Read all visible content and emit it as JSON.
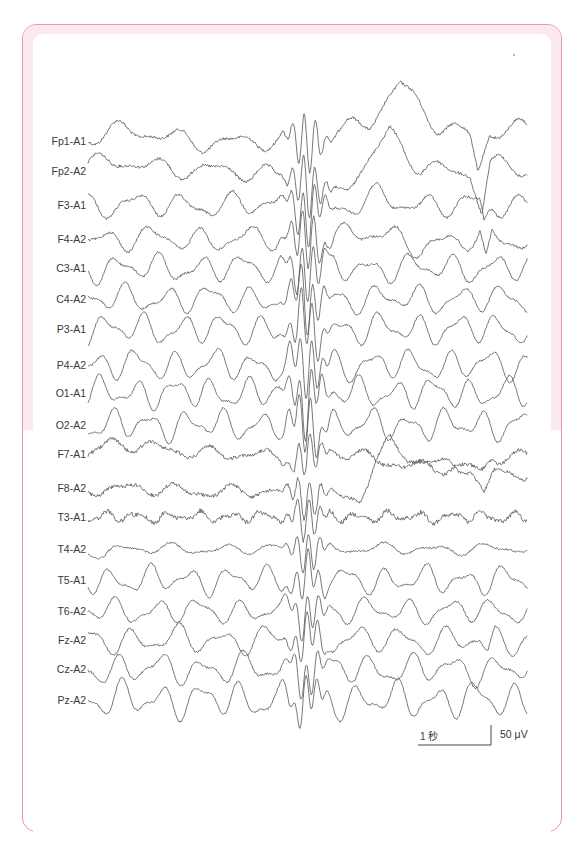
{
  "figure": {
    "frame_color": "#e79aa8",
    "band_color": "#fbe9ee",
    "trace_color": "#555555"
  },
  "chart_data": {
    "type": "line",
    "title": "",
    "x_range_px": [
      88,
      528
    ],
    "channels": [
      {
        "name": "Fp1-A1",
        "y": 141,
        "amp": 7,
        "freq": 0.11,
        "noise": 1.4,
        "drift": [
          [
            88,
            -6
          ],
          [
            120,
            -10
          ],
          [
            200,
            0
          ],
          [
            300,
            2
          ],
          [
            370,
            -20
          ],
          [
            400,
            -55
          ],
          [
            440,
            -15
          ],
          [
            470,
            -8
          ],
          [
            478,
            30
          ],
          [
            490,
            -10
          ],
          [
            528,
            -10
          ]
        ]
      },
      {
        "name": "Fp2-A2",
        "y": 171,
        "amp": 7,
        "freq": 0.11,
        "noise": 1.4,
        "drift": [
          [
            88,
            -4
          ],
          [
            120,
            -10
          ],
          [
            200,
            0
          ],
          [
            300,
            4
          ],
          [
            330,
            30
          ],
          [
            370,
            -10
          ],
          [
            390,
            -40
          ],
          [
            420,
            -5
          ],
          [
            470,
            4
          ],
          [
            482,
            40
          ],
          [
            490,
            -5
          ],
          [
            528,
            -3
          ]
        ]
      },
      {
        "name": "F3-A1",
        "y": 205,
        "amp": 9,
        "freq": 0.13,
        "noise": 1.2,
        "drift": [
          [
            88,
            0
          ],
          [
            300,
            0
          ],
          [
            340,
            6
          ],
          [
            380,
            -8
          ],
          [
            420,
            0
          ],
          [
            480,
            0
          ],
          [
            484,
            20
          ],
          [
            492,
            0
          ],
          [
            528,
            0
          ]
        ]
      },
      {
        "name": "F4-A2",
        "y": 239,
        "amp": 9,
        "freq": 0.13,
        "noise": 1.2,
        "drift": [
          [
            88,
            0
          ],
          [
            300,
            0
          ],
          [
            380,
            -5
          ],
          [
            420,
            6
          ],
          [
            480,
            0
          ],
          [
            486,
            30
          ],
          [
            492,
            0
          ],
          [
            528,
            0
          ]
        ]
      },
      {
        "name": "C3-A1",
        "y": 268,
        "amp": 10,
        "freq": 0.15,
        "noise": 1.0,
        "drift": [
          [
            88,
            0
          ],
          [
            528,
            0
          ]
        ]
      },
      {
        "name": "C4-A2",
        "y": 299,
        "amp": 10,
        "freq": 0.15,
        "noise": 1.0,
        "drift": [
          [
            88,
            0
          ],
          [
            528,
            0
          ]
        ]
      },
      {
        "name": "P3-A1",
        "y": 329,
        "amp": 11,
        "freq": 0.16,
        "noise": 0.9,
        "drift": [
          [
            88,
            0
          ],
          [
            528,
            0
          ]
        ]
      },
      {
        "name": "P4-A2",
        "y": 365,
        "amp": 11,
        "freq": 0.16,
        "noise": 0.9,
        "drift": [
          [
            88,
            0
          ],
          [
            528,
            0
          ]
        ]
      },
      {
        "name": "O1-A1",
        "y": 393,
        "amp": 11,
        "freq": 0.17,
        "noise": 0.9,
        "drift": [
          [
            88,
            0
          ],
          [
            528,
            0
          ]
        ]
      },
      {
        "name": "O2-A2",
        "y": 425,
        "amp": 11,
        "freq": 0.17,
        "noise": 0.9,
        "drift": [
          [
            88,
            0
          ],
          [
            528,
            0
          ]
        ]
      },
      {
        "name": "F7-A1",
        "y": 454,
        "amp": 5,
        "freq": 0.12,
        "noise": 1.8,
        "drift": [
          [
            88,
            0
          ],
          [
            110,
            -10
          ],
          [
            200,
            -2
          ],
          [
            300,
            5
          ],
          [
            330,
            -5
          ],
          [
            380,
            8
          ],
          [
            420,
            12
          ],
          [
            470,
            14
          ],
          [
            482,
            20
          ],
          [
            492,
            4
          ],
          [
            528,
            2
          ]
        ]
      },
      {
        "name": "F8-A2",
        "y": 488,
        "amp": 5,
        "freq": 0.12,
        "noise": 1.8,
        "drift": [
          [
            88,
            0
          ],
          [
            330,
            6
          ],
          [
            360,
            12
          ],
          [
            375,
            -25
          ],
          [
            390,
            -45
          ],
          [
            410,
            -30
          ],
          [
            470,
            -20
          ],
          [
            484,
            10
          ],
          [
            494,
            -15
          ],
          [
            528,
            -14
          ]
        ]
      },
      {
        "name": "T3-A1",
        "y": 517,
        "amp": 4,
        "freq": 0.2,
        "noise": 2.2,
        "drift": [
          [
            88,
            0
          ],
          [
            528,
            0
          ]
        ]
      },
      {
        "name": "T4-A2",
        "y": 549,
        "amp": 4,
        "freq": 0.12,
        "noise": 1.0,
        "drift": [
          [
            88,
            0
          ],
          [
            105,
            6
          ],
          [
            115,
            0
          ],
          [
            528,
            0
          ]
        ]
      },
      {
        "name": "T5-A1",
        "y": 580,
        "amp": 10,
        "freq": 0.16,
        "noise": 0.9,
        "drift": [
          [
            88,
            0
          ],
          [
            528,
            0
          ]
        ]
      },
      {
        "name": "T6-A2",
        "y": 611,
        "amp": 9,
        "freq": 0.15,
        "noise": 0.9,
        "drift": [
          [
            88,
            0
          ],
          [
            528,
            0
          ]
        ]
      },
      {
        "name": "Fz-A2",
        "y": 640,
        "amp": 10,
        "freq": 0.14,
        "noise": 1.0,
        "drift": [
          [
            88,
            0
          ],
          [
            480,
            0
          ],
          [
            488,
            18
          ],
          [
            495,
            0
          ],
          [
            528,
            0
          ]
        ]
      },
      {
        "name": "Cz-A2",
        "y": 669,
        "amp": 11,
        "freq": 0.15,
        "noise": 1.0,
        "drift": [
          [
            88,
            0
          ],
          [
            528,
            0
          ]
        ]
      },
      {
        "name": "Pz-A2",
        "y": 700,
        "amp": 13,
        "freq": 0.16,
        "noise": 0.9,
        "drift": [
          [
            88,
            0
          ],
          [
            528,
            0
          ]
        ]
      }
    ],
    "discharge": {
      "center_x": 307,
      "width": 22,
      "amp": 30
    },
    "scale_bar": {
      "time_label": "1 秒",
      "amplitude_label": "50 μV",
      "time_bar": {
        "x1": 418,
        "x2": 491,
        "y": 745
      },
      "amp_bar": {
        "x": 491,
        "y1": 725,
        "y2": 745
      }
    },
    "xlabel": "",
    "ylabel": ""
  }
}
